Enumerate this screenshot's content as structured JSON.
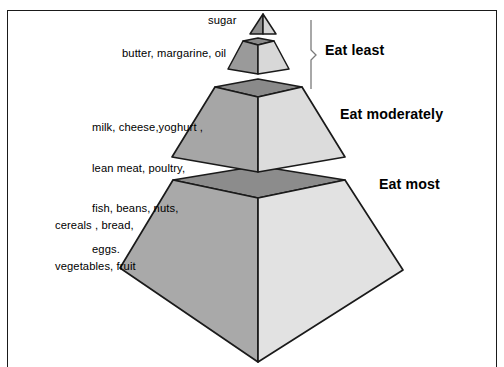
{
  "diagram": {
    "frame": {
      "border_color": "#1a1a1a"
    },
    "tiers": [
      {
        "id": "tier-sugar",
        "level": 1,
        "food_label": "sugar",
        "advice": "Eat least",
        "shape": "triangle-apex",
        "colors": {
          "left_face": "#8f8f8f",
          "right_face": "#d6d6d6",
          "outline": "#1a1a1a"
        }
      },
      {
        "id": "tier-fats",
        "level": 2,
        "food_label": "butter, margarine, oil",
        "advice": "Eat least",
        "shape": "frustum",
        "colors": {
          "left_face": "#9a9a9a",
          "right_face": "#d8d8d8",
          "top_face": "#8a8a8a",
          "outline": "#1a1a1a"
        }
      },
      {
        "id": "tier-protein",
        "level": 3,
        "food_label": "milk, cheese,yoghurt ,\nlean meat, poultry,\nfish, beans, nuts,\neggs.",
        "advice": "Eat moderately",
        "shape": "frustum",
        "colors": {
          "left_face": "#a6a6a6",
          "right_face": "#dcdcdc",
          "top_face": "#8a8a8a",
          "outline": "#1a1a1a"
        }
      },
      {
        "id": "tier-carbs",
        "level": 4,
        "food_label": "cereals , bread,\nvegetables, fruit",
        "advice": "Eat most",
        "shape": "frustum",
        "colors": {
          "left_face": "#a9a9a9",
          "right_face": "#e2e2e2",
          "top_face": "#8c8c8c",
          "outline": "#1a1a1a"
        }
      }
    ],
    "labels": {
      "sugar": "sugar",
      "fats": "butter, margarine, oil",
      "protein_line1": "milk, cheese,yoghurt ,",
      "protein_line2": "lean meat, poultry,",
      "protein_line3": "fish, beans, nuts,",
      "protein_line4": "eggs.",
      "carbs_line1": "cereals , bread,",
      "carbs_line2": "vegetables, fruit",
      "eat_least": "Eat least",
      "eat_moderately": "Eat moderately",
      "eat_most": "Eat most"
    },
    "bracket": {
      "name": "eat-least-bracket",
      "spans_tiers": [
        "tier-sugar",
        "tier-fats"
      ]
    }
  }
}
